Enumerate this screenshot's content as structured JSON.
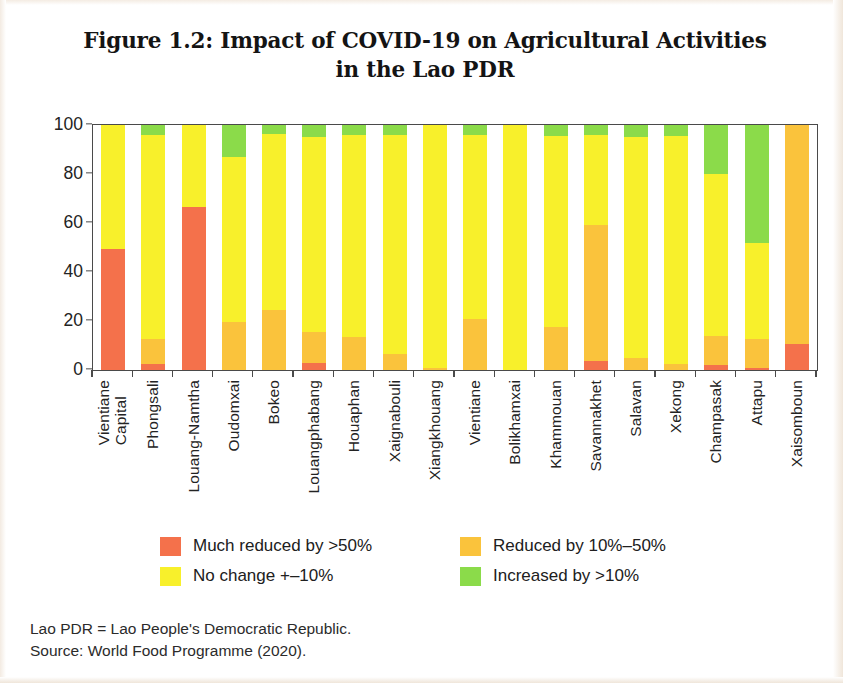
{
  "figure": {
    "title_line1": "Figure 1.2: Impact of COVID-19 on Agricultural Activities",
    "title_line2": "in the Lao PDR"
  },
  "footnote": {
    "line1": "Lao PDR = Lao People's Democratic Republic.",
    "line2": "Source: World Food Programme (2020)."
  },
  "legend": {
    "items": [
      {
        "label": "Much reduced by >50%",
        "color": "#F4714B"
      },
      {
        "label": "Reduced by 10%–50%",
        "color": "#FAC33C"
      },
      {
        "label": "No change +–10%",
        "color": "#F8F02B"
      },
      {
        "label": "Increased by >10%",
        "color": "#8BDB4A"
      }
    ]
  },
  "chart_data": {
    "type": "bar",
    "subtype": "stacked-100-percent",
    "title": "Figure 1.2: Impact of COVID-19 on Agricultural Activities in the Lao PDR",
    "xlabel": "",
    "ylabel": "Percent",
    "ylim": [
      0,
      100
    ],
    "yticks": [
      0,
      20,
      40,
      60,
      80,
      100
    ],
    "grid": false,
    "legend_position": "bottom",
    "categories": [
      "Vientiane Capital",
      "Phongsali",
      "Louang-Namtha",
      "Oudomxai",
      "Bokeo",
      "Louangphabang",
      "Houaphan",
      "Xaignabouli",
      "Xiangkhouang",
      "Vientiane",
      "Bolikhamxai",
      "Khammouan",
      "Savannakhet",
      "Salavan",
      "Xekong",
      "Champasak",
      "Attapu",
      "Xaisomboun"
    ],
    "category_lines": [
      [
        "Vientiane",
        "Capital"
      ],
      [
        "Phongsali"
      ],
      [
        "Louang-Namtha"
      ],
      [
        "Oudomxai"
      ],
      [
        "Bokeo"
      ],
      [
        "Louangphabang"
      ],
      [
        "Houaphan"
      ],
      [
        "Xaignabouli"
      ],
      [
        "Xiangkhouang"
      ],
      [
        "Vientiane"
      ],
      [
        "Bolikhamxai"
      ],
      [
        "Khammouan"
      ],
      [
        "Savannakhet"
      ],
      [
        "Salavan"
      ],
      [
        "Xekong"
      ],
      [
        "Champasak"
      ],
      [
        "Attapu"
      ],
      [
        "Xaisomboun"
      ]
    ],
    "series": [
      {
        "name": "Much reduced by >50%",
        "color": "#F4714B",
        "values": [
          49.5,
          2.5,
          66.5,
          0,
          0,
          3.0,
          0,
          0,
          0,
          0,
          0,
          0,
          3.5,
          0,
          0,
          2.0,
          1.0,
          10.5
        ]
      },
      {
        "name": "Reduced by 10%–50%",
        "color": "#FAC33C",
        "values": [
          0,
          10.0,
          0,
          19.5,
          24.5,
          12.5,
          13.5,
          6.5,
          0.8,
          21.0,
          0,
          17.5,
          55.5,
          5.0,
          2.5,
          12.0,
          11.5,
          89.5
        ]
      },
      {
        "name": "No change +–10%",
        "color": "#F8F02B",
        "values": [
          50.5,
          83.5,
          33.5,
          67.5,
          72.0,
          79.5,
          82.5,
          89.5,
          99.2,
          75.0,
          100,
          78.0,
          37.0,
          90.0,
          93.0,
          66.0,
          39.5,
          0
        ]
      },
      {
        "name": "Increased by >10%",
        "color": "#8BDB4A",
        "values": [
          0,
          4.0,
          0,
          13.0,
          3.5,
          5.0,
          4.0,
          4.0,
          0,
          4.0,
          0,
          4.5,
          4.0,
          5.0,
          4.5,
          20.0,
          48.0,
          0
        ]
      }
    ]
  }
}
